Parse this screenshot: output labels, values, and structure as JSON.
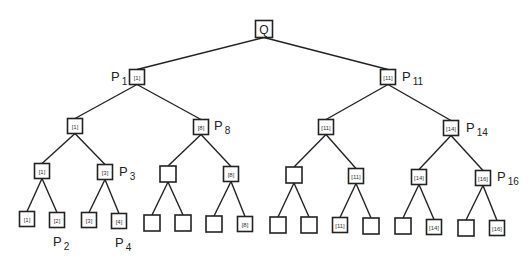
{
  "diagram": {
    "type": "binary-tree",
    "root": {
      "id": "root",
      "label": "Q",
      "x": 264,
      "y": 29,
      "size": 17
    },
    "nodes": [
      {
        "id": "n1",
        "label": "[1]",
        "x": 137,
        "y": 77,
        "size": 15,
        "parent": "root"
      },
      {
        "id": "n2",
        "label": "[11]",
        "x": 388,
        "y": 77,
        "size": 15,
        "parent": "root"
      },
      {
        "id": "n3",
        "label": "[1]",
        "x": 75,
        "y": 126,
        "size": 15,
        "parent": "n1"
      },
      {
        "id": "n4",
        "label": "[8]",
        "x": 201,
        "y": 127,
        "size": 15,
        "parent": "n1"
      },
      {
        "id": "n5",
        "label": "[11]",
        "x": 326,
        "y": 127,
        "size": 15,
        "parent": "n2"
      },
      {
        "id": "n6",
        "label": "[14]",
        "x": 451,
        "y": 128,
        "size": 15,
        "parent": "n2"
      },
      {
        "id": "n7",
        "label": "[1]",
        "x": 42,
        "y": 171,
        "size": 15,
        "parent": "n3"
      },
      {
        "id": "n8",
        "label": "[3]",
        "x": 105,
        "y": 172,
        "size": 15,
        "parent": "n3"
      },
      {
        "id": "n9",
        "label": "",
        "x": 168,
        "y": 174,
        "size": 16,
        "parent": "n4"
      },
      {
        "id": "n10",
        "label": "[8]",
        "x": 231,
        "y": 174,
        "size": 15,
        "parent": "n4"
      },
      {
        "id": "n11",
        "label": "",
        "x": 294,
        "y": 175,
        "size": 16,
        "parent": "n5"
      },
      {
        "id": "n12",
        "label": "[11]",
        "x": 356,
        "y": 176,
        "size": 15,
        "parent": "n5"
      },
      {
        "id": "n13",
        "label": "[14]",
        "x": 419,
        "y": 177,
        "size": 15,
        "parent": "n6"
      },
      {
        "id": "n14",
        "label": "[16]",
        "x": 483,
        "y": 178,
        "size": 15,
        "parent": "n6"
      },
      {
        "id": "n15",
        "label": "[1]",
        "x": 27,
        "y": 219,
        "size": 15,
        "parent": "n7"
      },
      {
        "id": "n16",
        "label": "[2]",
        "x": 57,
        "y": 220,
        "size": 15,
        "parent": "n7"
      },
      {
        "id": "n17",
        "label": "[3]",
        "x": 89,
        "y": 220,
        "size": 15,
        "parent": "n8"
      },
      {
        "id": "n18",
        "label": "[4]",
        "x": 119,
        "y": 221,
        "size": 15,
        "parent": "n8"
      },
      {
        "id": "n19",
        "label": "",
        "x": 152,
        "y": 223,
        "size": 16,
        "parent": "n9"
      },
      {
        "id": "n20",
        "label": "",
        "x": 183,
        "y": 223,
        "size": 16,
        "parent": "n9"
      },
      {
        "id": "n21",
        "label": "",
        "x": 214,
        "y": 224,
        "size": 16,
        "parent": "n10"
      },
      {
        "id": "n22",
        "label": "[8]",
        "x": 245,
        "y": 224,
        "size": 15,
        "parent": "n10"
      },
      {
        "id": "n23",
        "label": "",
        "x": 278,
        "y": 225,
        "size": 16,
        "parent": "n11"
      },
      {
        "id": "n24",
        "label": "",
        "x": 309,
        "y": 225,
        "size": 16,
        "parent": "n11"
      },
      {
        "id": "n25",
        "label": "[11]",
        "x": 340,
        "y": 225,
        "size": 15,
        "parent": "n12"
      },
      {
        "id": "n26",
        "label": "",
        "x": 371,
        "y": 226,
        "size": 16,
        "parent": "n12"
      },
      {
        "id": "n27",
        "label": "",
        "x": 403,
        "y": 226,
        "size": 16,
        "parent": "n13"
      },
      {
        "id": "n28",
        "label": "[14]",
        "x": 434,
        "y": 227,
        "size": 15,
        "parent": "n13"
      },
      {
        "id": "n29",
        "label": "",
        "x": 466,
        "y": 228,
        "size": 16,
        "parent": "n14"
      },
      {
        "id": "n30",
        "label": "[16]",
        "x": 497,
        "y": 228,
        "size": 15,
        "parent": "n14"
      }
    ],
    "p_labels": [
      {
        "main": "P",
        "sub": "1",
        "x": 111,
        "y": 81
      },
      {
        "main": "P",
        "sub": "11",
        "x": 402,
        "y": 81
      },
      {
        "main": "P",
        "sub": "8",
        "x": 214,
        "y": 130
      },
      {
        "main": "P",
        "sub": "14",
        "x": 466,
        "y": 132
      },
      {
        "main": "P",
        "sub": "3",
        "x": 119,
        "y": 176
      },
      {
        "main": "P",
        "sub": "16",
        "x": 497,
        "y": 181
      },
      {
        "main": "P",
        "sub": "2",
        "x": 53,
        "y": 246
      },
      {
        "main": "P",
        "sub": "4",
        "x": 115,
        "y": 247
      }
    ]
  }
}
